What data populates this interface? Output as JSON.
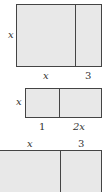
{
  "figures": [
    {
      "name": "area-model-1",
      "side_label": "x",
      "bottom_labels": [
        "x",
        "3"
      ]
    },
    {
      "name": "area-model-2",
      "side_label": "x",
      "bottom_labels": [
        "1",
        "2x"
      ]
    },
    {
      "name": "area-model-3",
      "top_labels": [
        "x",
        "3"
      ]
    }
  ]
}
